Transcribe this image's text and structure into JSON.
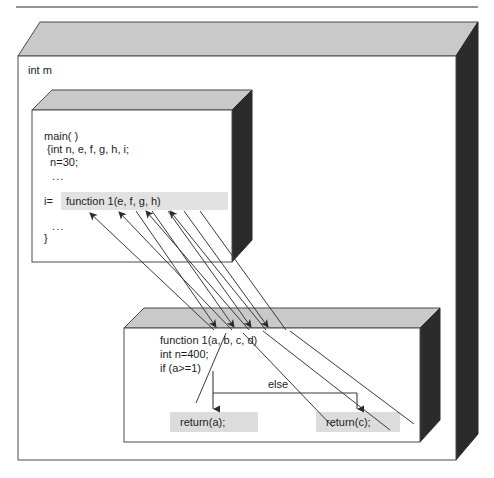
{
  "figure": {
    "type": "call-flow-diagram",
    "title_rule": true,
    "outer_box": {
      "label": "int m",
      "face_fill": "#ffffff",
      "top_fill": "#c9c9c9",
      "side_fill": "#2b2b2b",
      "stroke": "#4a4a4a"
    },
    "caller_box": {
      "name": "main-block",
      "top_fill": "#c9c9c9",
      "side_fill": "#2b2b2b",
      "lines": [
        "main( )",
        " {int n, e, f, g, h, i;",
        "  n=30;",
        "  ...",
        "i=",
        "  ...",
        "}"
      ],
      "call_label": "i=",
      "call_highlight": "function 1(e, f, g, h)",
      "highlight_fill": "#e2e2e2"
    },
    "callee_box": {
      "name": "function-block",
      "top_fill": "#c9c9c9",
      "side_fill": "#2b2b2b",
      "signature": "function 1(a, b, c, d)",
      "lines": [
        "function 1(a, b, c, d)",
        "int n=400;",
        "if (a>=1)"
      ],
      "else_label": "else",
      "return_then": "return(a);",
      "return_else": "return(c);",
      "highlight_fill": "#dcdcdc"
    },
    "arrows": {
      "count": 4,
      "direction": "bidirectional-parameter-binding",
      "stroke": "#3a3a3a",
      "pairs": [
        {
          "actual": "e",
          "formal": "a"
        },
        {
          "actual": "f",
          "formal": "b"
        },
        {
          "actual": "g",
          "formal": "c"
        },
        {
          "actual": "h",
          "formal": "d"
        }
      ]
    }
  }
}
